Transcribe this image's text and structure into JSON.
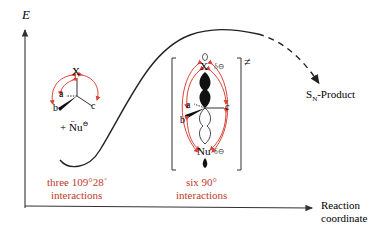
{
  "axes": {
    "y_label": "E",
    "x_label_line1": "Reaction",
    "x_label_line2": "coordinate"
  },
  "reactant": {
    "center_atom": "X",
    "substituents": [
      "a",
      "b",
      "c"
    ],
    "nucleophile": "+ N̈u",
    "nucleophile_charge": "⊖",
    "caption_line1": "three 109°28´",
    "caption_line2": "interactions"
  },
  "transition_state": {
    "top_atom": "X",
    "bottom_atom": "Nu",
    "partial_charge_top": "δ⊖",
    "partial_charge_bottom": "δ⊖",
    "substituents": [
      "a",
      "b",
      "c"
    ],
    "symbol": "≠",
    "caption_line1": "six 90°",
    "caption_line2": "interactions"
  },
  "product": {
    "label_main": "S",
    "label_sub": "N",
    "label_rest": "-Product"
  },
  "colors": {
    "curve": "#222222",
    "axis": "#333333",
    "interaction_arrows": "#d9443a",
    "caption": "#c0392b",
    "orbital_fill": "#111111"
  }
}
